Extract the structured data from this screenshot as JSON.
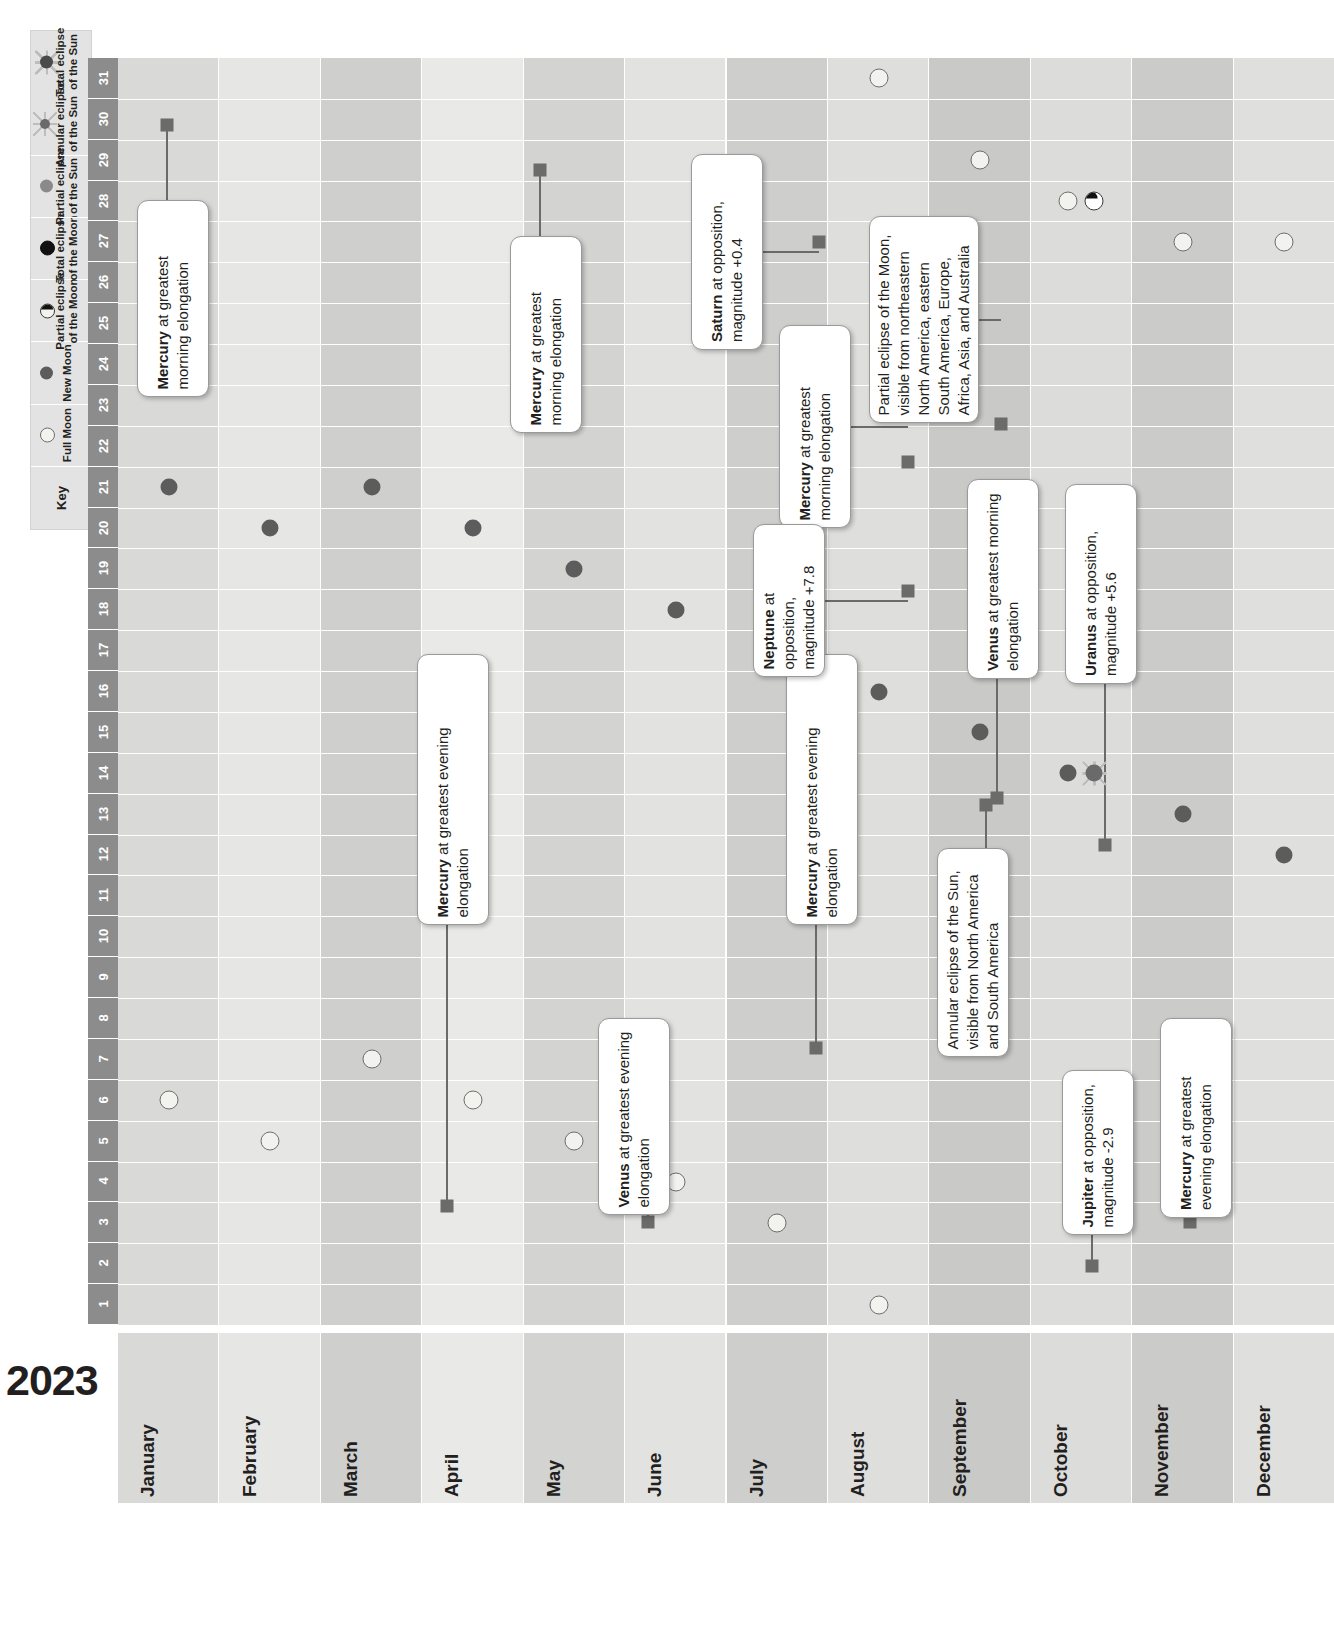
{
  "year": "2023",
  "key": {
    "title": "Key",
    "items": [
      {
        "icon": "full-moon-icon",
        "label": "Full Moon"
      },
      {
        "icon": "new-moon-icon",
        "label": "New Moon"
      },
      {
        "icon": "partial-lunar-eclipse-icon",
        "label": "Partial eclipse\nof the Moon"
      },
      {
        "icon": "total-lunar-eclipse-icon",
        "label": "Total eclipse\nof the Moon"
      },
      {
        "icon": "partial-solar-eclipse-icon",
        "label": "Partial eclipse\nof the Sun"
      },
      {
        "icon": "annular-solar-eclipse-icon",
        "label": "Annular eclipse\nof the Sun"
      },
      {
        "icon": "total-solar-eclipse-icon",
        "label": "Total eclipse\nof the Sun"
      }
    ]
  },
  "days": [
    "1",
    "2",
    "3",
    "4",
    "5",
    "6",
    "7",
    "8",
    "9",
    "10",
    "11",
    "12",
    "13",
    "14",
    "15",
    "16",
    "17",
    "18",
    "19",
    "20",
    "21",
    "22",
    "23",
    "24",
    "25",
    "26",
    "27",
    "28",
    "29",
    "30",
    "31"
  ],
  "months": [
    "January",
    "February",
    "March",
    "April",
    "May",
    "June",
    "July",
    "August",
    "September",
    "October",
    "November",
    "December"
  ],
  "colors": {
    "grid_light": "#e8e8e6",
    "grid_mid": "#d5d5d3",
    "grid_dark": "#c4c4c2",
    "day_header": "#8c8c8c",
    "key_bg": "#e3e3e3",
    "marker_dark": "#5c5c5c",
    "leader": "#6b6b6b",
    "text": "#231f20"
  },
  "chart_data": {
    "type": "table",
    "xlabel": "Month",
    "ylabel": "Day of month",
    "xrange": [
      "January",
      "December"
    ],
    "yrange": [
      1,
      31
    ],
    "grid": true,
    "legend_position": "top-left",
    "moon_markers": [
      {
        "month": "January",
        "day": 6,
        "type": "full-moon"
      },
      {
        "month": "January",
        "day": 21,
        "type": "new-moon"
      },
      {
        "month": "February",
        "day": 5,
        "type": "full-moon"
      },
      {
        "month": "February",
        "day": 20,
        "type": "new-moon"
      },
      {
        "month": "March",
        "day": 7,
        "type": "full-moon"
      },
      {
        "month": "March",
        "day": 21,
        "type": "new-moon"
      },
      {
        "month": "April",
        "day": 6,
        "type": "full-moon"
      },
      {
        "month": "April",
        "day": 20,
        "type": "new-moon"
      },
      {
        "month": "May",
        "day": 5,
        "type": "full-moon"
      },
      {
        "month": "May",
        "day": 19,
        "type": "new-moon"
      },
      {
        "month": "June",
        "day": 4,
        "type": "full-moon"
      },
      {
        "month": "June",
        "day": 18,
        "type": "new-moon"
      },
      {
        "month": "July",
        "day": 3,
        "type": "full-moon"
      },
      {
        "month": "July",
        "day": 17,
        "type": "new-moon"
      },
      {
        "month": "August",
        "day": 1,
        "type": "full-moon"
      },
      {
        "month": "August",
        "day": 16,
        "type": "new-moon"
      },
      {
        "month": "August",
        "day": 31,
        "type": "full-moon"
      },
      {
        "month": "September",
        "day": 15,
        "type": "new-moon"
      },
      {
        "month": "September",
        "day": 29,
        "type": "full-moon"
      },
      {
        "month": "October",
        "day": 14,
        "type": "new-moon"
      },
      {
        "month": "October",
        "day": 14,
        "type": "annular-solar-eclipse"
      },
      {
        "month": "October",
        "day": 28,
        "type": "full-moon"
      },
      {
        "month": "October",
        "day": 28,
        "type": "partial-lunar-eclipse"
      },
      {
        "month": "November",
        "day": 13,
        "type": "new-moon"
      },
      {
        "month": "November",
        "day": 27,
        "type": "full-moon"
      },
      {
        "month": "December",
        "day": 12,
        "type": "new-moon"
      },
      {
        "month": "December",
        "day": 27,
        "type": "full-moon"
      }
    ],
    "events": [
      {
        "month": "January",
        "day": 30,
        "text_bold": "Mercury",
        "text_rest": " at greatest morning elongation"
      },
      {
        "month": "April",
        "day": 11,
        "text_bold": "Mercury",
        "text_rest": " at greatest evening elongation"
      },
      {
        "month": "May",
        "day": 29,
        "text_bold": "Mercury",
        "text_rest": " at greatest morning elongation"
      },
      {
        "month": "July",
        "day": 10,
        "text_bold": "Mercury",
        "text_rest": " at greatest evening elongation"
      },
      {
        "month": "August",
        "day": 27,
        "text_bold": "Saturn",
        "text_rest": " at opposition, magnitude +0.4"
      },
      {
        "month": "August",
        "day": 22,
        "text_bold": "Mercury",
        "text_rest": " at greatest morning elongation"
      },
      {
        "month": "August",
        "day": 19,
        "text_bold": "Neptune",
        "text_rest": " at opposition, magnitude +7.8"
      },
      {
        "month": "April",
        "day": 4,
        "text_bold": "Venus",
        "text_rest": " at greatest evening elongation"
      },
      {
        "month": "September",
        "day": 23,
        "text_bold": "",
        "text_rest": "Partial eclipse of the Moon, visible from northeastern North America, eastern South America, Europe, Africa, Asia, and Australia"
      },
      {
        "month": "October",
        "day": 23,
        "text_bold": "Venus",
        "text_rest": " at greatest morning elongation"
      },
      {
        "month": "October",
        "day": 14,
        "text_bold": "",
        "text_rest": "Annular eclipse of the Sun, visible from North America and South America"
      },
      {
        "month": "November",
        "day": 13,
        "text_bold": "Uranus",
        "text_rest": " at opposition, magnitude +5.6"
      },
      {
        "month": "November",
        "day": 3,
        "text_bold": "Jupiter",
        "text_rest": " at opposition, magnitude -2.9"
      },
      {
        "month": "December",
        "day": 4,
        "text_bold": "Mercury",
        "text_rest": " at greatest evening elongation"
      }
    ]
  }
}
